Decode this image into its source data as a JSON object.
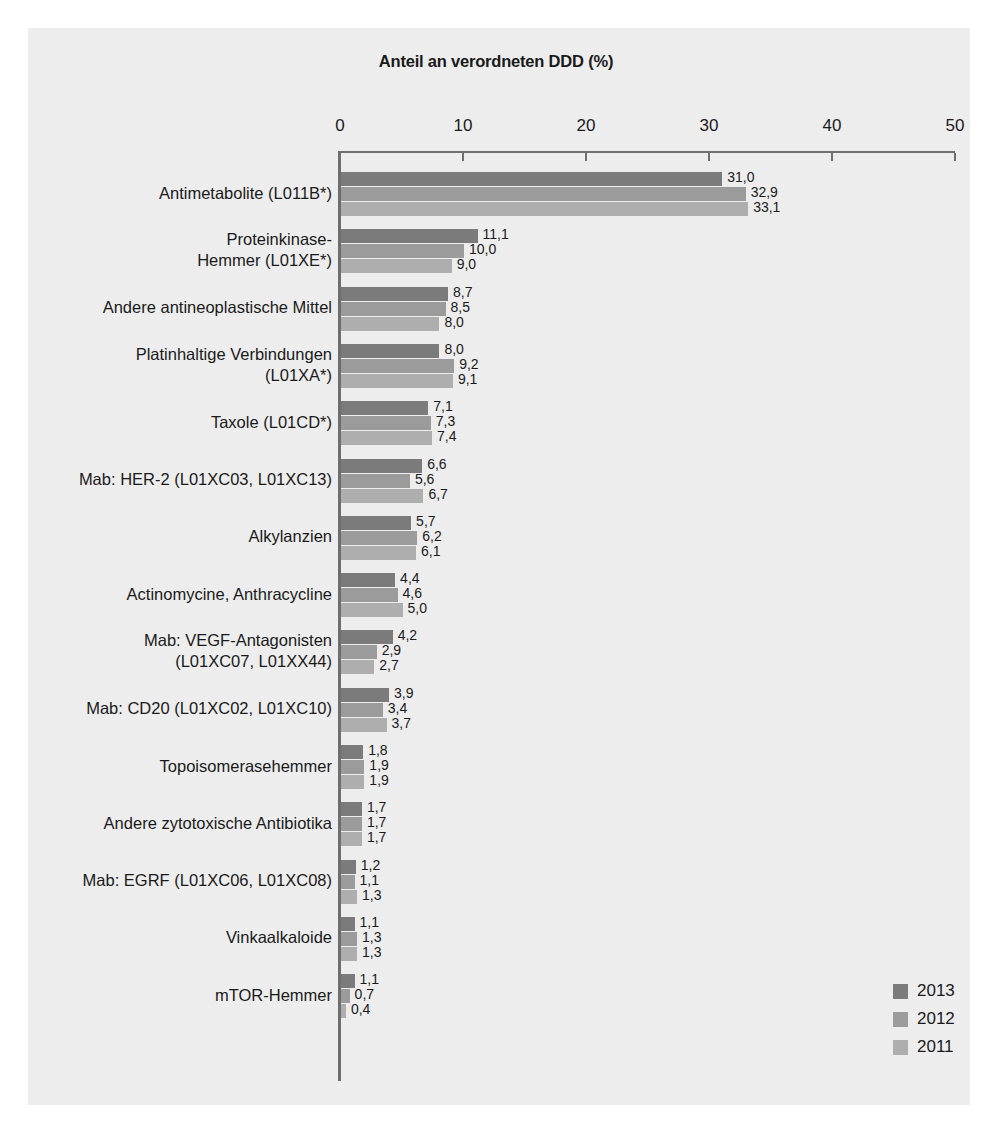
{
  "chart_data": {
    "type": "bar",
    "orientation": "horizontal",
    "title": "Anteil an verordneten DDD (%)",
    "xlabel": "",
    "ylabel": "",
    "xlim": [
      0,
      50
    ],
    "xticks": [
      0,
      10,
      20,
      30,
      40,
      50
    ],
    "xtick_labels": [
      "0",
      "10",
      "20",
      "30",
      "40",
      "50"
    ],
    "grid": false,
    "legend_position": "bottom-right",
    "decimal_separator": ",",
    "categories": [
      "Antimetabolite (L011B*)",
      "Proteinkinase-\nHemmer (L01XE*)",
      "Andere antineoplastische Mittel",
      "Platinhaltige Verbindungen\n(L01XA*)",
      "Taxole (L01CD*)",
      "Mab: HER-2 (L01XC03, L01XC13)",
      "Alkylanzien",
      "Actinomycine, Anthracycline",
      "Mab: VEGF-Antagonisten\n(L01XC07, L01XX44)",
      "Mab: CD20 (L01XC02, L01XC10)",
      "Topoisomerasehemmer",
      "Andere zytotoxische Antibiotika",
      "Mab: EGRF (L01XC06, L01XC08)",
      "Vinkaalkaloide",
      "mTOR-Hemmer"
    ],
    "series": [
      {
        "name": "2013",
        "color": "#7b7b7b",
        "values": [
          31.0,
          11.1,
          8.7,
          8.0,
          7.1,
          6.6,
          5.7,
          4.4,
          4.2,
          3.9,
          1.8,
          1.7,
          1.2,
          1.1,
          1.1
        ],
        "labels": [
          "31,0",
          "11,1",
          "8,7",
          "8,0",
          "7,1",
          "6,6",
          "5,7",
          "4,4",
          "4,2",
          "3,9",
          "1,8",
          "1,7",
          "1,2",
          "1,1",
          "1,1"
        ]
      },
      {
        "name": "2012",
        "color": "#9b9b9b",
        "values": [
          32.9,
          10.0,
          8.5,
          9.2,
          7.3,
          5.6,
          6.2,
          4.6,
          2.9,
          3.4,
          1.9,
          1.7,
          1.1,
          1.3,
          0.7
        ],
        "labels": [
          "32,9",
          "10,0",
          "8,5",
          "9,2",
          "7,3",
          "5,6",
          "6,2",
          "4,6",
          "2,9",
          "3,4",
          "1,9",
          "1,7",
          "1,1",
          "1,3",
          "0,7"
        ]
      },
      {
        "name": "2011",
        "color": "#aeaeae",
        "values": [
          33.1,
          9.0,
          8.0,
          9.1,
          7.4,
          6.7,
          6.1,
          5.0,
          2.7,
          3.7,
          1.9,
          1.7,
          1.3,
          1.3,
          0.4
        ],
        "labels": [
          "33,1",
          "9,0",
          "8,0",
          "9,1",
          "7,4",
          "6,7",
          "6,1",
          "5,0",
          "2,7",
          "3,7",
          "1,9",
          "1,7",
          "1,3",
          "1,3",
          "0,4"
        ]
      }
    ]
  },
  "legend": {
    "items": [
      {
        "label": "2013",
        "color": "#7b7b7b"
      },
      {
        "label": "2012",
        "color": "#9b9b9b"
      },
      {
        "label": "2011",
        "color": "#aeaeae"
      }
    ]
  },
  "colors": {
    "background": "#ffffff",
    "panel": "#ededed",
    "axis": "#6e6e6e",
    "text": "#1a1a1a"
  }
}
